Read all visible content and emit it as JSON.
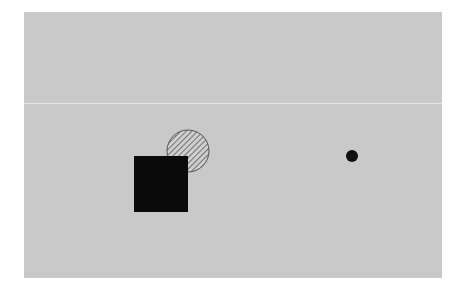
{
  "canvas": {
    "width": 463,
    "height": 293,
    "background_color": "#ffffff",
    "panel_color": "#c9c9c9",
    "divider_color": "#e6e6e6"
  },
  "shapes": [
    {
      "type": "circle",
      "name": "hatched-circle",
      "cx": 188,
      "cy": 151,
      "r": 21,
      "fill": "diagonal-hatch",
      "stroke_color": "#555555",
      "hatch_color": "#555555"
    },
    {
      "type": "square",
      "name": "black-square",
      "x": 134,
      "y": 156,
      "width": 54,
      "height": 56,
      "fill_color": "#0a0a0a"
    },
    {
      "type": "dot",
      "name": "black-dot",
      "cx": 352,
      "cy": 156,
      "r": 6,
      "fill_color": "#111111"
    }
  ]
}
